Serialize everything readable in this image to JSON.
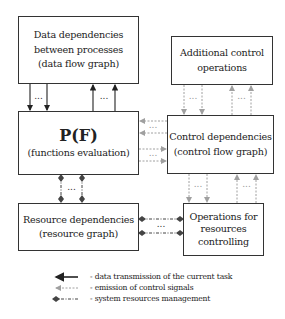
{
  "boxes": {
    "data_dependencies": {
      "lines": [
        "Data dependencies",
        "between processes",
        "(data flow graph)"
      ]
    },
    "additional_control": {
      "lines": [
        "Additional control",
        "operations"
      ]
    },
    "pf": {
      "title": "P(F)",
      "subtitle": "(functions evaluation)"
    },
    "control_dependencies": {
      "lines": [
        "Control dependencies",
        "(control flow graph)"
      ]
    },
    "resource_dependencies": {
      "lines": [
        "Resource dependencies",
        "(resource graph)"
      ]
    },
    "operations_resources": {
      "lines": [
        "Operations for",
        "resources",
        "controlling"
      ]
    }
  },
  "ellipsis": "...",
  "legend": {
    "items": [
      {
        "style": "solid-arrow",
        "label": "- data transmission of the current task"
      },
      {
        "style": "dotted-arrow",
        "label": "- emission of control signals"
      },
      {
        "style": "dashdot-diamond",
        "label": "- system resources management"
      }
    ]
  },
  "colors": {
    "border": "#333333",
    "data_arrow": "#222222",
    "control_arrow": "#9a9a9a",
    "resource_arrow": "#444444"
  }
}
